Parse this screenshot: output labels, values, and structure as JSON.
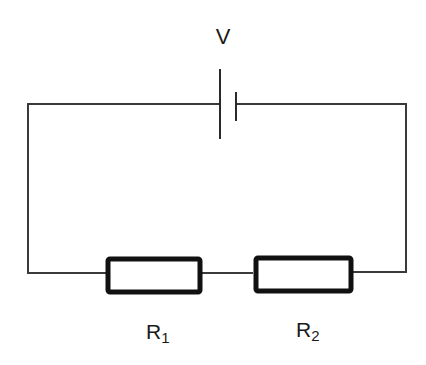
{
  "diagram": {
    "type": "series circuit",
    "colors": {
      "wire": "#3a3a3a",
      "component": "#111111",
      "background": "#ffffff",
      "text": "#1a1a1a"
    },
    "battery": {
      "label": "V"
    },
    "resistors": [
      {
        "label_main": "R",
        "label_sub": "1"
      },
      {
        "label_main": "R",
        "label_sub": "2"
      }
    ]
  }
}
